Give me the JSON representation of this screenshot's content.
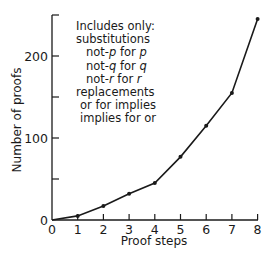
{
  "chart_data": {
    "type": "line",
    "title": "",
    "xlabel": "Proof steps",
    "ylabel": "Number of proofs",
    "x": [
      0,
      1,
      2,
      3,
      4,
      5,
      6,
      7,
      8
    ],
    "series": [
      {
        "name": "Number of proofs",
        "values": [
          0,
          5,
          17,
          32,
          45,
          77,
          115,
          155,
          245
        ]
      }
    ],
    "xlim": [
      0,
      8
    ],
    "ylim": [
      0,
      250
    ],
    "xticks": [
      "0",
      "1",
      "2",
      "3",
      "4",
      "5",
      "6",
      "7",
      "8"
    ],
    "yticks_labeled": [
      "0",
      "100",
      "200"
    ],
    "yticks_minor": [
      50,
      150,
      250
    ],
    "grid": false,
    "legend": null,
    "annotation": {
      "lines": [
        "Includes only:",
        "substitutions",
        "not-p for p",
        "not-q for q",
        "not-r for r",
        "replacements",
        "or for implies",
        "implies for or"
      ]
    }
  },
  "annotation": {
    "l1": "Includes only:",
    "l2": "substitutions",
    "l3a": "not-",
    "l3b": "p",
    "l3c": " for ",
    "l3d": "p",
    "l4a": "not-",
    "l4b": "q",
    "l4c": " for ",
    "l4d": "q",
    "l5a": "not-",
    "l5b": "r",
    "l5c": " for ",
    "l5d": "r",
    "l6": "replacements",
    "l7": "or for implies",
    "l8": "implies for or"
  },
  "axes": {
    "xlabel": "Proof steps",
    "ylabel": "Number of proofs",
    "xticks": [
      "0",
      "1",
      "2",
      "3",
      "4",
      "5",
      "6",
      "7",
      "8"
    ],
    "yticks": {
      "0": "0",
      "100": "100",
      "200": "200"
    }
  }
}
